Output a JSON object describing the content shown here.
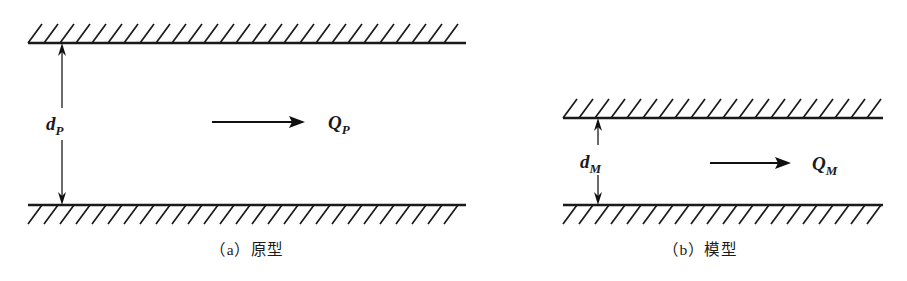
{
  "figure": {
    "background_color": "#ffffff",
    "ink_color": "#1a1a1a",
    "panels": [
      {
        "id": "panel-a",
        "caption": "（a）原型",
        "caption_label": "(a)",
        "caption_text": "原型",
        "gap_label_main": "d",
        "gap_label_sub": "P",
        "flow_label_main": "Q",
        "flow_label_sub": "P",
        "wall_left_x": 28,
        "wall_right_x": 466,
        "top_wall_y": 43,
        "bottom_wall_y": 205,
        "gap_px": 162,
        "dim_arrow_x": 62,
        "flow_arrow_x1": 212,
        "flow_arrow_x2": 305,
        "flow_arrow_y": 122,
        "hatch_spacing": 16,
        "hatch_length": 19,
        "hatch_angle_deg": 45
      },
      {
        "id": "panel-b",
        "caption": "（b）模型",
        "caption_label": "(b)",
        "caption_text": "模型",
        "gap_label_main": "d",
        "gap_label_sub": "M",
        "flow_label_main": "Q",
        "flow_label_sub": "M",
        "wall_left_x": 563,
        "wall_right_x": 883,
        "top_wall_y": 118,
        "bottom_wall_y": 205,
        "gap_px": 87,
        "dim_arrow_x": 598,
        "flow_arrow_x1": 710,
        "flow_arrow_x2": 790,
        "flow_arrow_y": 163,
        "hatch_spacing": 16,
        "hatch_length": 19,
        "hatch_angle_deg": 45
      }
    ]
  }
}
